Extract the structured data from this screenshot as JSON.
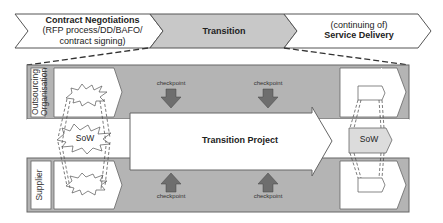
{
  "phases": [
    {
      "title": "Contract Negotiations",
      "lines": [
        "(RFP process/DD/BAFO/",
        "contract signing)"
      ],
      "fill": "#ffffff"
    },
    {
      "title": "Transition",
      "lines": [],
      "fill": "#c8c8c8"
    },
    {
      "pre": "(continuing of)",
      "title": "Service Delivery",
      "fill": "#ffffff"
    }
  ],
  "swimlanes": {
    "top": {
      "label_line1": "Outsourcing",
      "label_line2": "Organisation"
    },
    "bottom": {
      "label": "Supplier"
    }
  },
  "main_arrow": {
    "label": "Transition Project"
  },
  "sow": {
    "left_label": "SoW",
    "right_label": "SoW"
  },
  "checkpoints": {
    "top": [
      "checkpoint",
      "checkpoint"
    ],
    "bottom": [
      "checkpoint",
      "checkpoint"
    ]
  },
  "colors": {
    "lane_fill": "#b4b4b4",
    "transition_fill": "#c8c8c8",
    "checkpoint_arrow": "#6e6e6e",
    "outline": "#555555"
  }
}
